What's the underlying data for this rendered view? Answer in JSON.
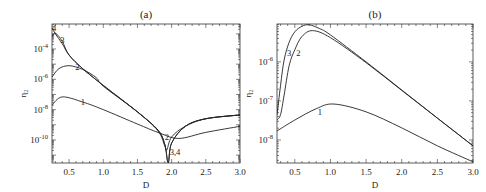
{
  "chart_data": [
    {
      "type": "line",
      "title": "(a)",
      "xlabel": "D",
      "ylabel": "η₂",
      "yscale": "log",
      "xlim": [
        0.25,
        3.0
      ],
      "ylim_log10": [
        -11.52,
        -2.35
      ],
      "xticks": [
        0.5,
        1.0,
        1.5,
        2.0,
        2.5,
        3.0
      ],
      "xtick_labels": [
        "0.5",
        "1.0",
        "1.5",
        "2.0",
        "2.5",
        "3.0"
      ],
      "yticks_log10": [
        -4,
        -6,
        -8,
        -10
      ],
      "ytick_labels": [
        {
          "base": "10",
          "exp": "-4"
        },
        {
          "base": "10",
          "exp": "-6"
        },
        {
          "base": "10",
          "exp": "-8"
        },
        {
          "base": "10",
          "exp": "-10"
        }
      ],
      "series": [
        {
          "name": "1",
          "x": [
            0.25,
            0.4,
            0.7,
            1.0,
            1.5,
            1.8,
            2.1,
            2.5,
            3.0
          ],
          "log10_y": [
            -7.69,
            -7.16,
            -7.5,
            -8.0,
            -8.95,
            -9.5,
            -9.9,
            -9.5,
            -9.1
          ]
        },
        {
          "name": "2",
          "x": [
            0.25,
            0.35,
            0.5,
            0.7,
            0.9,
            1.0,
            1.5,
            1.8,
            1.9,
            1.93,
            2.0,
            2.2,
            2.5,
            3.0
          ],
          "log10_y": [
            -5.85,
            -5.3,
            -5.1,
            -5.35,
            -5.9,
            -6.45,
            -8.15,
            -9.4,
            -10.4,
            -10.65,
            -9.8,
            -9.1,
            -8.6,
            -8.35
          ]
        },
        {
          "name": "3",
          "x": [
            0.25,
            0.3,
            0.4,
            0.5,
            0.7,
            1.0,
            1.5,
            1.8,
            1.9,
            1.95,
            2.0,
            2.2,
            2.5,
            3.0
          ],
          "log10_y": [
            -3.2,
            -2.95,
            -3.5,
            -4.4,
            -5.3,
            -6.4,
            -8.15,
            -9.35,
            -10.3,
            -11.5,
            -10.2,
            -9.1,
            -8.6,
            -8.35
          ]
        },
        {
          "name": "4",
          "x": [
            0.25,
            0.3,
            0.4,
            0.5,
            0.7,
            1.0,
            1.5,
            1.8,
            1.9,
            1.95,
            2.0,
            2.2,
            2.5,
            3.0
          ],
          "log10_y": [
            -2.6,
            -3.0,
            -3.65,
            -4.4,
            -5.3,
            -6.4,
            -8.15,
            -9.35,
            -10.3,
            -11.5,
            -10.2,
            -9.1,
            -8.6,
            -8.35
          ]
        }
      ],
      "annotations": [
        {
          "text": "4",
          "x": 0.28,
          "log10_y": -2.8
        },
        {
          "text": "3",
          "x": 0.4,
          "log10_y": -3.6
        },
        {
          "text": "2",
          "x": 0.62,
          "log10_y": -5.4
        },
        {
          "text": "1",
          "x": 0.7,
          "log10_y": -7.7
        },
        {
          "text": "2",
          "x": 1.93,
          "log10_y": -10.0
        },
        {
          "text": "3,4",
          "x": 2.05,
          "log10_y": -11.0
        }
      ]
    },
    {
      "type": "line",
      "title": "(b)",
      "xlabel": "D",
      "ylabel": "η₂",
      "yscale": "log",
      "xlim": [
        0.25,
        3.0
      ],
      "ylim_log10": [
        -8.59,
        -5.03
      ],
      "xticks": [
        0.5,
        1.0,
        1.5,
        2.0,
        2.5,
        3.0
      ],
      "xtick_labels": [
        "0.5",
        "1.0",
        "1.5",
        "2.0",
        "2.5",
        "3.0"
      ],
      "yticks_log10": [
        -6,
        -7,
        -8
      ],
      "ytick_labels": [
        {
          "base": "10",
          "exp": "-6"
        },
        {
          "base": "10",
          "exp": "-7"
        },
        {
          "base": "10",
          "exp": "-8"
        }
      ],
      "series": [
        {
          "name": "1",
          "x": [
            0.25,
            0.5,
            0.8,
            1.05,
            1.5,
            2.0,
            2.5,
            3.0
          ],
          "log10_y": [
            -7.77,
            -7.49,
            -7.2,
            -7.08,
            -7.28,
            -7.69,
            -8.15,
            -8.56
          ]
        },
        {
          "name": "2",
          "x": [
            0.25,
            0.3,
            0.35,
            0.42,
            0.5,
            0.6,
            0.75,
            1.0,
            1.5,
            2.0,
            2.5,
            3.0
          ],
          "log10_y": [
            -7.49,
            -7.35,
            -6.85,
            -6.1,
            -5.69,
            -5.35,
            -5.2,
            -5.38,
            -6.02,
            -6.73,
            -7.44,
            -8.15
          ]
        },
        {
          "name": "3",
          "x": [
            0.25,
            0.3,
            0.35,
            0.42,
            0.5,
            0.6,
            0.7,
            0.85,
            1.0,
            1.5,
            2.0,
            2.5,
            3.0
          ],
          "log10_y": [
            -7.36,
            -6.6,
            -5.95,
            -5.5,
            -5.23,
            -5.09,
            -5.05,
            -5.15,
            -5.31,
            -6.0,
            -6.72,
            -7.44,
            -8.15
          ]
        }
      ],
      "annotations": [
        {
          "text": "3",
          "x": 0.42,
          "log10_y": -5.85
        },
        {
          "text": "2",
          "x": 0.55,
          "log10_y": -5.85
        },
        {
          "text": "1",
          "x": 0.85,
          "log10_y": -7.35
        }
      ]
    }
  ]
}
